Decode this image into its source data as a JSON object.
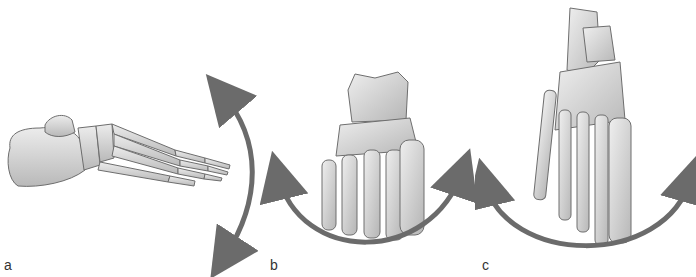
{
  "figure": {
    "panels": [
      {
        "id": "a",
        "label": "a",
        "view": "lateral view of foot skeleton",
        "motion": "vertical arc arrow (dorsiflexion/plantarflexion)"
      },
      {
        "id": "b",
        "label": "b",
        "view": "anterior view of foot skeleton",
        "motion": "horizontal arc arrow beneath foot (inversion/eversion)"
      },
      {
        "id": "c",
        "label": "c",
        "view": "dorsal/superior view of foot skeleton",
        "motion": "horizontal arc arrow beneath foot (abduction/adduction)"
      }
    ],
    "colors": {
      "background": "#ffffff",
      "bone_fill": "#dcdcdc",
      "bone_shade": "#b5b5b5",
      "bone_outline": "#6e6e6e",
      "arrow": "#6b6b6b",
      "label": "#333333"
    }
  }
}
